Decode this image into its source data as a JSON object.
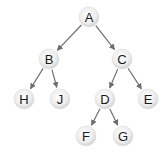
{
  "diagram": {
    "type": "binary-tree",
    "nodes": [
      {
        "id": "A",
        "label": "A",
        "x": 89,
        "y": 17
      },
      {
        "id": "B",
        "label": "B",
        "x": 49,
        "y": 59
      },
      {
        "id": "C",
        "label": "C",
        "x": 122,
        "y": 59
      },
      {
        "id": "H",
        "label": "H",
        "x": 24,
        "y": 99
      },
      {
        "id": "J",
        "label": "J",
        "x": 60,
        "y": 99
      },
      {
        "id": "D",
        "label": "D",
        "x": 105,
        "y": 99
      },
      {
        "id": "E",
        "label": "E",
        "x": 148,
        "y": 99
      },
      {
        "id": "F",
        "label": "F",
        "x": 86,
        "y": 136
      },
      {
        "id": "G",
        "label": "G",
        "x": 123,
        "y": 136
      }
    ],
    "edges": [
      {
        "from": "A",
        "to": "B"
      },
      {
        "from": "A",
        "to": "C"
      },
      {
        "from": "B",
        "to": "H"
      },
      {
        "from": "B",
        "to": "J"
      },
      {
        "from": "C",
        "to": "D"
      },
      {
        "from": "C",
        "to": "E"
      },
      {
        "from": "D",
        "to": "F"
      },
      {
        "from": "D",
        "to": "G"
      }
    ],
    "colors": {
      "edge": "#6e6e6e",
      "node_fill_center": "#ffffff",
      "node_fill_edge": "#d4d4d4",
      "node_stroke": "#e2e2e2",
      "label": "#1a1a1a"
    },
    "node_radius": 10
  }
}
